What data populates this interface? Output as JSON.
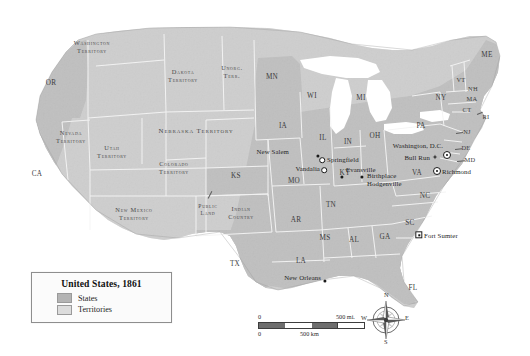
{
  "map": {
    "title": "United States, 1861",
    "legend": {
      "title": "United States, 1861",
      "entries": [
        {
          "label": "States",
          "swatch_color": "#b4b4b4"
        },
        {
          "label": "Territories",
          "swatch_color": "#d8d8d8"
        }
      ]
    },
    "scale": {
      "miles": {
        "min": "0",
        "max": "500 mi.",
        "unit": "mi."
      },
      "km": {
        "min": "0",
        "max": "500 km",
        "unit": "km"
      }
    },
    "compass": {
      "north": "N",
      "east": "E",
      "south": "S",
      "west": "W"
    },
    "colors": {
      "state_fill": "#b4b4b4",
      "territory_fill": "#d5d5d5",
      "water": "#ffffff",
      "border": "#f2f2f2",
      "label_text": "#3a3a3a"
    },
    "territories": [
      {
        "name": "WASHINGTON TERRITORY",
        "lines": [
          "Washington",
          "Territory"
        ],
        "x": 92,
        "y": 47
      },
      {
        "name": "DAKOTA TERRITORY",
        "lines": [
          "Dakota",
          "Territory"
        ],
        "x": 183,
        "y": 76
      },
      {
        "name": "UNORG. TERR.",
        "lines": [
          "Unorg.",
          "Terr."
        ],
        "x": 232,
        "y": 72
      },
      {
        "name": "NEBRASKA TERRITORY",
        "lines": [
          "Nebraska Territory"
        ],
        "x": 196,
        "y": 131
      },
      {
        "name": "NEVADA TERRITORY",
        "lines": [
          "Nevada",
          "Territory"
        ],
        "x": 71,
        "y": 137
      },
      {
        "name": "UTAH TERRITORY",
        "lines": [
          "Utah",
          "Territory"
        ],
        "x": 112,
        "y": 152
      },
      {
        "name": "COLORADO TERRITORY",
        "lines": [
          "Colorado",
          "Territory"
        ],
        "x": 174,
        "y": 168
      },
      {
        "name": "NEW MEXICO TERRITORY",
        "lines": [
          "New Mexico",
          "Territory"
        ],
        "x": 134,
        "y": 214
      },
      {
        "name": "INDIAN COUNTRY",
        "lines": [
          "Indian",
          "Country"
        ],
        "x": 241,
        "y": 213
      },
      {
        "name": "PUBLIC LAND",
        "lines": [
          "Public",
          "Land"
        ],
        "x": 208,
        "y": 210
      }
    ],
    "states": [
      {
        "abbr": "OR",
        "x": 51,
        "y": 84
      },
      {
        "abbr": "CA",
        "x": 37,
        "y": 175
      },
      {
        "abbr": "MN",
        "x": 272,
        "y": 78
      },
      {
        "abbr": "WI",
        "x": 312,
        "y": 97
      },
      {
        "abbr": "MI",
        "x": 361,
        "y": 99
      },
      {
        "abbr": "IA",
        "x": 283,
        "y": 127
      },
      {
        "abbr": "IL",
        "x": 323,
        "y": 139
      },
      {
        "abbr": "IN",
        "x": 348,
        "y": 143
      },
      {
        "abbr": "OH",
        "x": 375,
        "y": 137
      },
      {
        "abbr": "PA",
        "x": 421,
        "y": 127
      },
      {
        "abbr": "NY",
        "x": 441,
        "y": 99
      },
      {
        "abbr": "ME",
        "x": 487,
        "y": 56
      },
      {
        "abbr": "VT",
        "x": 461,
        "y": 80
      },
      {
        "abbr": "NH",
        "x": 473,
        "y": 89
      },
      {
        "abbr": "MA",
        "x": 472,
        "y": 99
      },
      {
        "abbr": "CT",
        "x": 467,
        "y": 110
      },
      {
        "abbr": "RI",
        "x": 484,
        "y": 116
      },
      {
        "abbr": "NJ",
        "x": 466,
        "y": 132
      },
      {
        "abbr": "DE",
        "x": 465,
        "y": 148
      },
      {
        "abbr": "MD",
        "x": 469,
        "y": 159
      },
      {
        "abbr": "KS",
        "x": 236,
        "y": 177
      },
      {
        "abbr": "MO",
        "x": 294,
        "y": 182
      },
      {
        "abbr": "KY",
        "x": 345,
        "y": 174
      },
      {
        "abbr": "VA",
        "x": 417,
        "y": 174
      },
      {
        "abbr": "TN",
        "x": 331,
        "y": 206
      },
      {
        "abbr": "NC",
        "x": 425,
        "y": 197
      },
      {
        "abbr": "SC",
        "x": 410,
        "y": 224
      },
      {
        "abbr": "AR",
        "x": 296,
        "y": 221
      },
      {
        "abbr": "MS",
        "x": 325,
        "y": 239
      },
      {
        "abbr": "AL",
        "x": 354,
        "y": 241
      },
      {
        "abbr": "GA",
        "x": 385,
        "y": 238
      },
      {
        "abbr": "LA",
        "x": 301,
        "y": 262
      },
      {
        "abbr": "TX",
        "x": 235,
        "y": 265
      },
      {
        "abbr": "FL",
        "x": 413,
        "y": 289
      }
    ],
    "places": [
      {
        "name": "New Salem",
        "lines": [
          "New Salem"
        ],
        "marker": "dot",
        "mx": 318,
        "my": 156,
        "lx": 289,
        "ly": 155,
        "anchor": "right"
      },
      {
        "name": "Springfield",
        "lines": [
          "Springfield"
        ],
        "marker": "open",
        "mx": 322,
        "my": 159,
        "lx": 327,
        "ly": 159,
        "anchor": "left"
      },
      {
        "name": "Vandalia",
        "lines": [
          "Vandalia"
        ],
        "marker": "open",
        "mx": 324,
        "my": 170,
        "lx": 320,
        "ly": 170,
        "anchor": "right"
      },
      {
        "name": "Evansville",
        "lines": [
          "Evansville"
        ],
        "marker": "dot",
        "mx": 342,
        "my": 177,
        "lx": 347,
        "ly": 170,
        "anchor": "left"
      },
      {
        "name": "Birthplace Hodgenville",
        "lines": [
          "Birthplace",
          "Hodgenville"
        ],
        "marker": "dot",
        "mx": 362,
        "my": 177,
        "lx": 367,
        "ly": 177,
        "anchor": "left"
      },
      {
        "name": "Washington, D.C.",
        "lines": [
          "Washington, D.C."
        ],
        "marker": "cap",
        "mx": 447,
        "my": 155,
        "lx": 443,
        "ly": 146,
        "anchor": "right"
      },
      {
        "name": "Bull Run",
        "lines": [
          "Bull Run"
        ],
        "marker": "batt",
        "mx": 435,
        "my": 157,
        "lx": 431,
        "ly": 157,
        "anchor": "right"
      },
      {
        "name": "Richmond",
        "lines": [
          "Richmond"
        ],
        "marker": "cap",
        "mx": 437,
        "my": 171,
        "lx": 442,
        "ly": 172,
        "anchor": "left"
      },
      {
        "name": "Fort Sumter",
        "lines": [
          "Fort Sumter"
        ],
        "marker": "sq",
        "mx": 419,
        "my": 235,
        "lx": 424,
        "ly": 236,
        "anchor": "left"
      },
      {
        "name": "New Orleans",
        "lines": [
          "New Orleans"
        ],
        "marker": "dot",
        "mx": 325,
        "my": 280,
        "lx": 321,
        "ly": 278,
        "anchor": "right"
      }
    ]
  }
}
